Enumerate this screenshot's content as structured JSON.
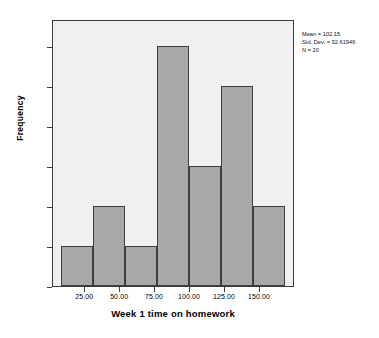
{
  "chart_data": {
    "type": "bar",
    "chart_style": "histogram",
    "title": "",
    "xlabel": "Week 1 time on homework",
    "ylabel": "Frequency",
    "categories": [
      "12.5-33.9",
      "33.9-55.4",
      "55.4-76.8",
      "76.8-98.2",
      "98.2-119.6",
      "119.6-141.1",
      "141.1-162.5"
    ],
    "bin_edges": [
      12.5,
      33.93,
      55.36,
      76.79,
      98.21,
      119.64,
      141.07,
      162.5
    ],
    "values": [
      1,
      2,
      1,
      6,
      3,
      5,
      2
    ],
    "bar_left_px": [
      8,
      40,
      72,
      104,
      136,
      168,
      200
    ],
    "bar_width_px": 32,
    "xlim": [
      2.0,
      175.0
    ],
    "ylim": [
      0,
      6.675
    ],
    "xticks": [
      25.0,
      50.0,
      75.0,
      100.0,
      125.0,
      150.0
    ],
    "xtick_labels": [
      "25.00",
      "50.00",
      "75.00",
      "100.00",
      "125.00",
      "150.00"
    ],
    "yticks": [
      0.0,
      1.0,
      2.0,
      3.0,
      4.0,
      5.0,
      6.0
    ],
    "ytick_labels": [
      "0.0",
      "1.0",
      "2.0",
      "3.0",
      "4.0",
      "5.0",
      "6.0"
    ],
    "grid": false,
    "legend": false,
    "bar_fill_color": "#a8a8a8",
    "bar_edge_color": "#3f3f3f",
    "plot_background_color": "#f0f0f0",
    "figure_background_color": "#ffffff"
  },
  "annotation": {
    "mean_label": "Mean = 102.15",
    "std_dev_label": "Std. Dev. = 32.61946",
    "n_label": "N = 20"
  }
}
